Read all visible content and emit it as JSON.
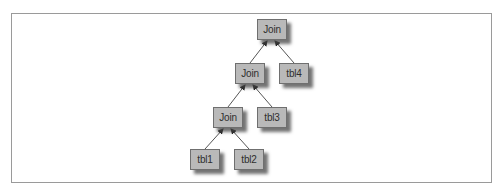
{
  "diagram": {
    "type": "join-tree",
    "colors": {
      "node_fill": "#b9b9b9",
      "node_border": "#6f6f6f",
      "node_shadow": "#464646",
      "edge": "#555555",
      "frame": "#9a9a9a"
    },
    "nodes": [
      {
        "id": "join1",
        "label": "Join"
      },
      {
        "id": "join2",
        "label": "Join"
      },
      {
        "id": "tbl4",
        "label": "tbl4"
      },
      {
        "id": "join3",
        "label": "Join"
      },
      {
        "id": "tbl3",
        "label": "tbl3"
      },
      {
        "id": "tbl1",
        "label": "tbl1"
      },
      {
        "id": "tbl2",
        "label": "tbl2"
      }
    ],
    "edges": [
      {
        "from": "join2",
        "to": "join1"
      },
      {
        "from": "tbl4",
        "to": "join1"
      },
      {
        "from": "join3",
        "to": "join2"
      },
      {
        "from": "tbl3",
        "to": "join2"
      },
      {
        "from": "tbl1",
        "to": "join3"
      },
      {
        "from": "tbl2",
        "to": "join3"
      }
    ]
  }
}
